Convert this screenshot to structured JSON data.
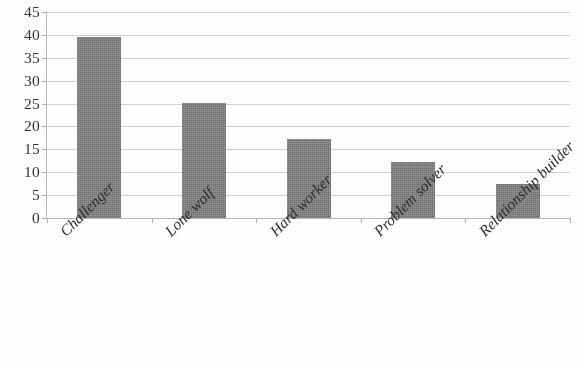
{
  "chart_data": {
    "type": "bar",
    "title": "",
    "subtitle": "",
    "xlabel": "",
    "ylabel": "",
    "categories": [
      "Challenger",
      "Lone wolf",
      "Hard worker",
      "Problem solver",
      "Relationship builder"
    ],
    "values": [
      39.5,
      25.1,
      17.2,
      12.2,
      7.4
    ],
    "series": [
      {
        "name": "",
        "values": [
          39.5,
          25.1,
          17.2,
          12.2,
          7.4
        ]
      }
    ],
    "ylim": [
      0,
      45
    ],
    "y_ticks": [
      0,
      5,
      10,
      15,
      20,
      25,
      30,
      35,
      40,
      45
    ],
    "y_tick_labels": [
      "0",
      "5",
      "10",
      "15",
      "20",
      "25",
      "30",
      "35",
      "40",
      "45"
    ],
    "grid": true,
    "grid_axis": "y",
    "legend": false,
    "legend_position": "none",
    "annotations": [],
    "bar_color": "#808080",
    "gridline_color": "#c9c9c9",
    "axis_color": "#b9b9b9",
    "background_color": "#ffffff",
    "label_rotation": -45
  }
}
